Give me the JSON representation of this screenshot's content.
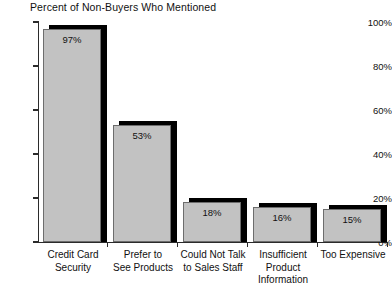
{
  "chart_data": {
    "type": "bar",
    "title": "Percent of Non-Buyers Who Mentioned",
    "xlabel": "",
    "ylabel": "",
    "ylim": [
      0,
      100
    ],
    "grid": false,
    "legend": null,
    "y_ticks": [
      "0%",
      "20%",
      "40%",
      "60%",
      "80%",
      "100%"
    ],
    "y_tick_values": [
      0,
      20,
      40,
      60,
      80,
      100
    ],
    "categories": [
      "Credit Card Security",
      "Prefer to See Products",
      "Could Not Talk to Sales Staff",
      "Insufficient Product Information",
      "Too Expensive"
    ],
    "category_lines": [
      [
        "Credit Card",
        "Security"
      ],
      [
        "Prefer to",
        "See Products"
      ],
      [
        "Could Not Talk",
        "to Sales Staff"
      ],
      [
        "Insufficient",
        "Product",
        "Information"
      ],
      [
        "Too Expensive"
      ]
    ],
    "values": [
      97,
      53,
      18,
      16,
      15
    ],
    "value_labels": [
      "97%",
      "53%",
      "18%",
      "16%",
      "15%"
    ],
    "colors": {
      "bar_fill": "#c2c2c2",
      "bar_border": "#6d6d6d",
      "bar_shadow": "#000000",
      "axis": "#2b2b2b",
      "text": "#111111",
      "background": "#ffffff"
    }
  }
}
